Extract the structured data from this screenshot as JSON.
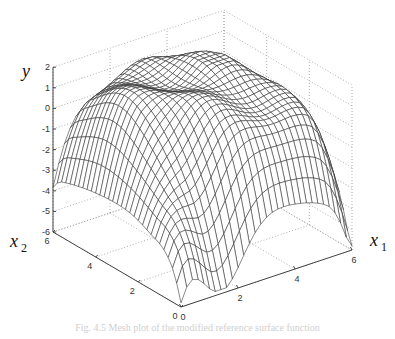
{
  "chart_data": {
    "type": "surface",
    "title": "",
    "xlabel": "x1",
    "ylabel": "x2",
    "zlabel": "y",
    "x1_ticks": [
      "0",
      "2",
      "4",
      "6"
    ],
    "x2_ticks": [
      "0",
      "2",
      "4",
      "6"
    ],
    "y_ticks": [
      "2",
      "1",
      "0",
      "-1",
      "-2",
      "-3",
      "-4",
      "-5",
      "-6"
    ],
    "x1_range": [
      0,
      6
    ],
    "x2_range": [
      0,
      6
    ],
    "y_range": [
      -6,
      2
    ],
    "grid": true,
    "style": "wireframe mesh, black lines on white",
    "mesh_resolution": 31,
    "surface_description": "dome-shaped mesh peaking near y≈1.5 around the center, dropping to about -2 at the (0,0) corner, about -4.8 at (0,6), about -4.6 at (6,0), with a deep trough near the front-center",
    "sample_points": [
      {
        "x1": 0,
        "x2": 0,
        "y": -2.0
      },
      {
        "x1": 0,
        "x2": 6,
        "y": -4.8
      },
      {
        "x1": 6,
        "x2": 0,
        "y": -4.6
      },
      {
        "x1": 3,
        "x2": 3,
        "y": 0.5
      },
      {
        "x1": 2,
        "x2": 5,
        "y": 1.5
      },
      {
        "x1": 5,
        "x2": 4,
        "y": 1.0
      }
    ]
  },
  "labels": {
    "y_axis": "y",
    "x2_axis": "x",
    "x2_sub": "2",
    "x1_axis": "x",
    "x1_sub": "1"
  },
  "caption": "Fig. 4.5  Mesh plot of the modified reference surface function"
}
